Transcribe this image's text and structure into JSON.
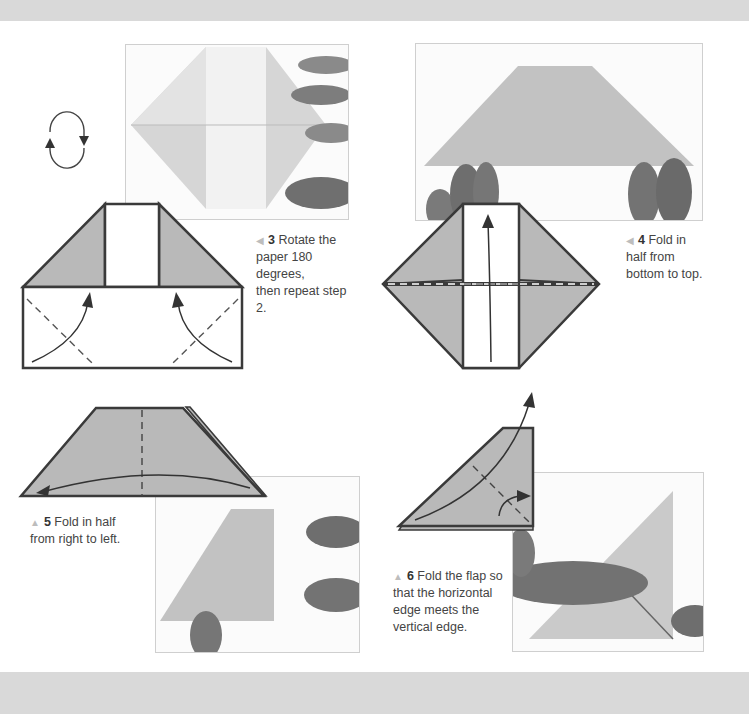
{
  "page": {
    "type": "origami instruction page",
    "colors": {
      "paper_gray": "#b9b9b9",
      "band_gray": "#d9d9d9",
      "outline": "#3a3a3a",
      "arrow": "#3a3a3a",
      "caption_text": "#444444",
      "marker": "#bdbdbd"
    }
  },
  "rotate_icon": {
    "name": "rotate-180-icon"
  },
  "steps": [
    {
      "number": "3",
      "marker": "◀",
      "text": "Rotate the paper 180 degrees, then repeat step 2."
    },
    {
      "number": "4",
      "marker": "◀",
      "text": "Fold in half from bottom to top."
    },
    {
      "number": "5",
      "marker": "▲",
      "text": "Fold in half from right to left."
    },
    {
      "number": "6",
      "marker": "▲",
      "text": "Fold the flap so that the horizontal edge meets the vertical edge."
    }
  ],
  "caption_lines": {
    "step3": [
      "Rotate the",
      "paper 180 degrees,",
      "then repeat step 2."
    ],
    "step4": [
      "Fold in",
      "half from",
      "bottom to top."
    ],
    "step5": [
      "Fold in half",
      "from right to left."
    ],
    "step6": [
      "Fold the flap so",
      "that the horizontal",
      "edge meets the",
      "vertical edge."
    ]
  }
}
